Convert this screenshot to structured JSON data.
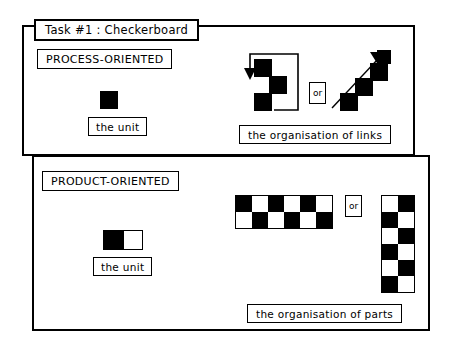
{
  "diagram": {
    "title": "Task #1 : Checkerboard",
    "title_prefix": "Task",
    "title_hash": "#1",
    "title_suffix": ": Checkerboard"
  },
  "process_section": {
    "tag": "PROCESS-ORIENTED",
    "unit_label": "the unit",
    "unit_icon": "black-square",
    "organisation_label": "the organisation of links",
    "or_label": "or",
    "left_figure": {
      "icon": "looping-arrow-staircase",
      "squares": 3,
      "arrow": "loop-down-left"
    },
    "right_figure": {
      "icon": "diagonal-arrow-staircase",
      "squares": 4,
      "arrow": "up-right-diagonal"
    }
  },
  "product_section": {
    "tag": "PRODUCT-ORIENTED",
    "unit_label": "the unit",
    "unit_icon": "black-white-pair",
    "organisation_label": "the organisation of parts",
    "or_label": "or",
    "horizontal_board": {
      "icon": "checkerboard-horizontal",
      "cols": 6,
      "rows": 2,
      "first_cell": "black",
      "cell_px": 16
    },
    "vertical_board": {
      "icon": "checkerboard-vertical",
      "cols": 2,
      "rows": 6,
      "first_cell": "white",
      "cell_px": 16
    }
  },
  "colors": {
    "ink": "#000000",
    "paper": "#ffffff"
  }
}
